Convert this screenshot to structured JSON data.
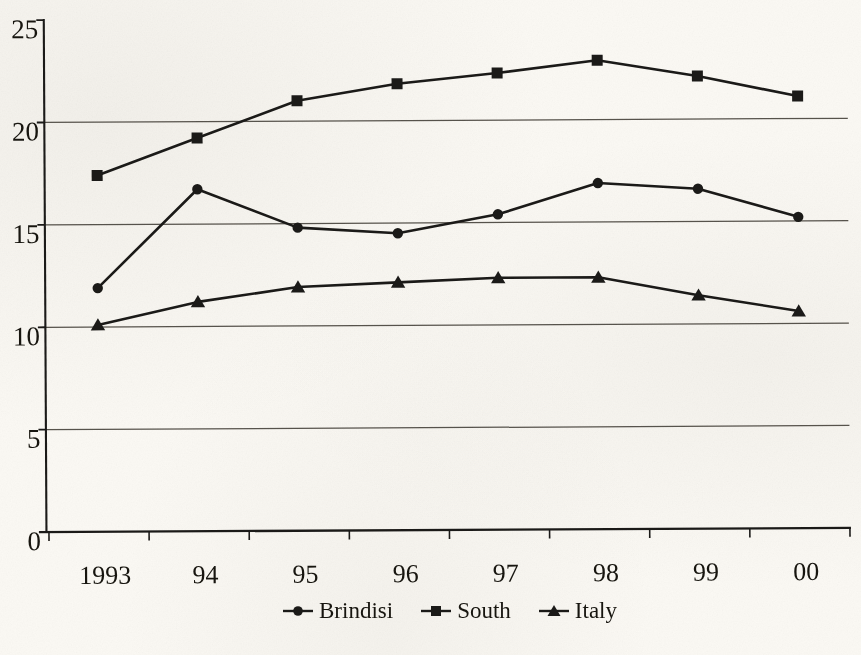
{
  "page": {
    "background_color": "#fbf9f4"
  },
  "chart_data": {
    "type": "line",
    "title": "",
    "xlabel": "",
    "ylabel": "",
    "categories": [
      "1993",
      "94",
      "95",
      "96",
      "97",
      "98",
      "99",
      "00"
    ],
    "series": [
      {
        "name": "Brindisi",
        "marker": "circle",
        "values": [
          11.9,
          16.7,
          14.8,
          14.5,
          15.4,
          16.9,
          16.6,
          15.2
        ]
      },
      {
        "name": "South",
        "marker": "square",
        "values": [
          17.4,
          19.2,
          21.0,
          21.8,
          22.3,
          22.9,
          22.1,
          21.1
        ]
      },
      {
        "name": "Italy",
        "marker": "triangle",
        "values": [
          10.1,
          11.2,
          11.9,
          12.1,
          12.3,
          12.3,
          11.4,
          10.6
        ]
      }
    ],
    "ylim": [
      0,
      25
    ],
    "yticks": [
      0,
      5,
      10,
      15,
      20,
      25
    ],
    "gridline_values": [
      5,
      10,
      15,
      20
    ],
    "grid": "horizontal",
    "legend_position": "bottom",
    "colors": {
      "series_line": "#1b1a18",
      "gridline": "#57534c",
      "text": "#17150f",
      "background": "#fbf9f4"
    }
  }
}
